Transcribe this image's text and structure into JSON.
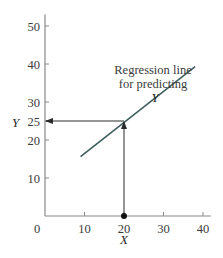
{
  "chart_data": {
    "type": "line",
    "title": "",
    "xlabel": "X",
    "ylabel": "Y",
    "xlim": [
      0,
      42
    ],
    "ylim": [
      0,
      53
    ],
    "x_ticks": [
      0,
      10,
      20,
      30,
      40
    ],
    "y_ticks": [
      10,
      20,
      25,
      30,
      40,
      50
    ],
    "x_tick_labels": [
      "0",
      "10",
      "20",
      "30",
      "40"
    ],
    "y_tick_labels": [
      "10",
      "20",
      "25",
      "30",
      "40",
      "50"
    ],
    "grid": false,
    "legend": null,
    "series": [
      {
        "name": "Regression line for predicting Y",
        "x": [
          9,
          38
        ],
        "y": [
          15.6,
          39.3
        ],
        "color": "#3f5f5c"
      }
    ],
    "annotations": [
      {
        "text": "Regression line for predicting Y",
        "lines": [
          "Regression line",
          "for predicting",
          "Y"
        ],
        "x": 28,
        "y": 41
      },
      {
        "type": "point",
        "x": 20,
        "y": 0,
        "marker": "filled-circle"
      },
      {
        "type": "arrow",
        "from": [
          20,
          0
        ],
        "to": [
          20,
          25
        ],
        "description": "vertical arrow from X=20 up to regression line"
      },
      {
        "type": "arrow",
        "from": [
          20,
          25
        ],
        "to": [
          0,
          25
        ],
        "description": "horizontal arrow from regression line to Y axis at 25"
      }
    ],
    "predicted": {
      "x": 20,
      "y": 25
    }
  },
  "labels": {
    "annot_line1": "Regression line",
    "annot_line2": "for predicting",
    "annot_line3": "Y",
    "y_var": "Y",
    "x_var": "X",
    "origin": "0"
  }
}
